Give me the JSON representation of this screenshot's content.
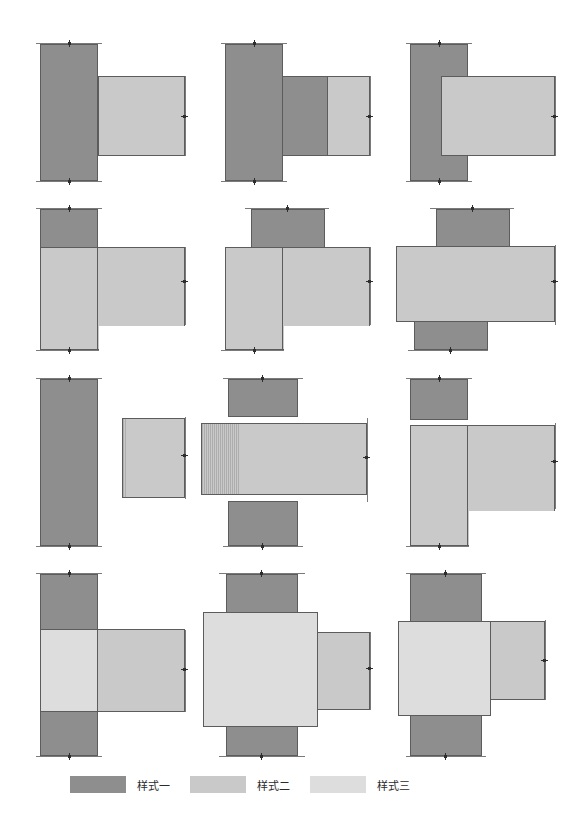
{
  "figure": {
    "top_caption": "",
    "styles": {
      "s1_color": "#8e8e8e",
      "s2_color": "#c9c9c9",
      "s3_color": "#dddddd",
      "outline_color": "#5c5c5c",
      "mark_color": "#2e2e2e",
      "background": "#ffffff"
    }
  },
  "legend": {
    "items": [
      {
        "label": "样式一",
        "style": "s1",
        "color": "#8e8e8e"
      },
      {
        "label": "样式二",
        "style": "s2",
        "color": "#c9c9c9"
      },
      {
        "label": "样式三",
        "style": "s3",
        "color": "#dddddd"
      }
    ]
  },
  "grid": {
    "rows": 4,
    "cols": 3,
    "cells": [
      {
        "index": 1,
        "row": 1,
        "col": 1,
        "name": "column-flush-beam-right",
        "parts": [
          "样式一",
          "样式二"
        ]
      },
      {
        "index": 2,
        "row": 1,
        "col": 2,
        "name": "column-haunch-beam-right",
        "parts": [
          "样式一",
          "样式二"
        ]
      },
      {
        "index": 3,
        "row": 1,
        "col": 3,
        "name": "beam-overlap-column-right",
        "parts": [
          "样式一",
          "样式二"
        ]
      },
      {
        "index": 4,
        "row": 2,
        "col": 1,
        "name": "short-column-over-l-panel",
        "parts": [
          "样式一",
          "样式二"
        ]
      },
      {
        "index": 5,
        "row": 2,
        "col": 2,
        "name": "centered-column-over-l-panel",
        "parts": [
          "样式一",
          "样式二"
        ]
      },
      {
        "index": 6,
        "row": 2,
        "col": 3,
        "name": "cross-column-through-beam",
        "parts": [
          "样式一",
          "样式二"
        ]
      },
      {
        "index": 7,
        "row": 3,
        "col": 1,
        "name": "detached-column-and-beam",
        "parts": [
          "样式一",
          "样式二"
        ]
      },
      {
        "index": 8,
        "row": 3,
        "col": 2,
        "name": "detached-cross-beam-through",
        "parts": [
          "样式一",
          "样式二"
        ]
      },
      {
        "index": 9,
        "row": 3,
        "col": 3,
        "name": "detached-block-over-l-panel",
        "parts": [
          "样式一",
          "样式二"
        ]
      },
      {
        "index": 10,
        "row": 4,
        "col": 1,
        "name": "column-with-joint-panel-beam-right",
        "parts": [
          "样式一",
          "样式二",
          "样式三"
        ]
      },
      {
        "index": 11,
        "row": 4,
        "col": 2,
        "name": "wide-joint-panel-cross",
        "parts": [
          "样式一",
          "样式二",
          "样式三"
        ]
      },
      {
        "index": 12,
        "row": 4,
        "col": 3,
        "name": "offset-joint-panel-cross",
        "parts": [
          "样式一",
          "样式二",
          "样式三"
        ]
      }
    ]
  }
}
